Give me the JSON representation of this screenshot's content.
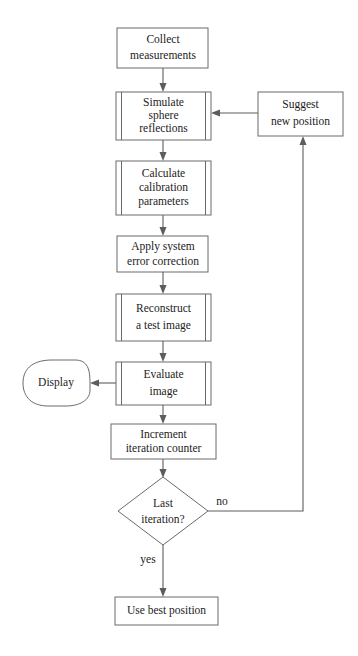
{
  "diagram": {
    "colors": {
      "background": "#ffffff",
      "node_stroke": "#6a6a6a",
      "connector": "#5d5d5d",
      "text": "#1c1c1c"
    },
    "nodes": {
      "collect": {
        "shape": "process",
        "lines": [
          "Collect",
          "measurements"
        ]
      },
      "simulate": {
        "shape": "predefined-process",
        "lines": [
          "Simulate",
          "sphere",
          "reflections"
        ]
      },
      "suggest": {
        "shape": "process",
        "lines": [
          "Suggest",
          "new position"
        ]
      },
      "calculate": {
        "shape": "predefined-process",
        "lines": [
          "Calculate",
          "calibration",
          "parameters"
        ]
      },
      "apply": {
        "shape": "process",
        "lines": [
          "Apply system",
          "error correction"
        ]
      },
      "reconstruct": {
        "shape": "predefined-process",
        "lines": [
          "Reconstruct",
          "a test image"
        ]
      },
      "evaluate": {
        "shape": "predefined-process",
        "lines": [
          "Evaluate",
          "image"
        ]
      },
      "display": {
        "shape": "terminator",
        "lines": [
          "Display"
        ]
      },
      "increment": {
        "shape": "process",
        "lines": [
          "Increment",
          "iteration counter"
        ]
      },
      "decision": {
        "shape": "decision",
        "lines": [
          "Last",
          "iteration?"
        ]
      },
      "use_best": {
        "shape": "process",
        "lines": [
          "Use  best position"
        ]
      }
    },
    "edge_labels": {
      "no": "no",
      "yes": "yes"
    }
  }
}
